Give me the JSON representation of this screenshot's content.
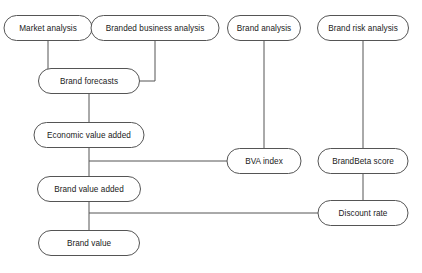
{
  "diagram": {
    "type": "flowchart",
    "background_color": "#ffffff",
    "node_fill_color": "#ffffff",
    "node_border_color": "#555555",
    "edge_color": "#555555",
    "text_color": "#1a1a1a",
    "nodes": [
      {
        "id": "market-analysis",
        "label": "Market analysis",
        "cx": 48,
        "cy": 28,
        "w": 88,
        "h": 25
      },
      {
        "id": "branded-business-analysis",
        "label": "Branded business analysis",
        "cx": 155,
        "cy": 28,
        "w": 128,
        "h": 25
      },
      {
        "id": "brand-analysis",
        "label": "Brand analysis",
        "cx": 264,
        "cy": 28,
        "w": 73,
        "h": 25
      },
      {
        "id": "brand-risk-analysis",
        "label": "Brand risk analysis",
        "cx": 363,
        "cy": 28,
        "w": 91,
        "h": 25
      },
      {
        "id": "brand-forecasts",
        "label": "Brand forecasts",
        "cx": 89,
        "cy": 81,
        "w": 101,
        "h": 25
      },
      {
        "id": "economic-value-added",
        "label": "Economic value added",
        "cx": 89,
        "cy": 135,
        "w": 110,
        "h": 25
      },
      {
        "id": "bva-index",
        "label": "BVA index",
        "cx": 264,
        "cy": 161,
        "w": 74,
        "h": 25
      },
      {
        "id": "brandbeta-score",
        "label": "BrandBeta score",
        "cx": 363,
        "cy": 161,
        "w": 90,
        "h": 25
      },
      {
        "id": "brand-value-added",
        "label": "Brand value added",
        "cx": 89,
        "cy": 189,
        "w": 103,
        "h": 25
      },
      {
        "id": "discount-rate",
        "label": "Discount rate",
        "cx": 363,
        "cy": 213,
        "w": 90,
        "h": 25
      },
      {
        "id": "brand-value",
        "label": "Brand value",
        "cx": 89,
        "cy": 243,
        "w": 101,
        "h": 25
      }
    ],
    "edges": [
      {
        "id": "market-analysis-to-brand-forecasts",
        "from": "market-analysis",
        "to": "brand-forecasts",
        "points": "48,40.5 48,81 38.5,81"
      },
      {
        "id": "branded-business-analysis-to-brand-forecasts",
        "from": "branded-business-analysis",
        "to": "brand-forecasts",
        "points": "155,40.5 155,81 139.5,81"
      },
      {
        "id": "brand-forecasts-to-economic-value-added",
        "from": "brand-forecasts",
        "to": "economic-value-added",
        "points": "89,93.5 89,122.5"
      },
      {
        "id": "economic-value-added-to-brand-value-added",
        "from": "economic-value-added",
        "to": "brand-value-added",
        "points": "89,147.5 89,176.5"
      },
      {
        "id": "brand-analysis-to-bva-index",
        "from": "brand-analysis",
        "to": "bva-index",
        "points": "264,40.5 264,148.5"
      },
      {
        "id": "bva-index-to-spine",
        "from": "bva-index",
        "to": "economic-value-added",
        "points": "227,161 89,161"
      },
      {
        "id": "brand-risk-analysis-to-brandbeta-score",
        "from": "brand-risk-analysis",
        "to": "brandbeta-score",
        "points": "363,40.5 363,148.5"
      },
      {
        "id": "brandbeta-score-to-discount-rate",
        "from": "brandbeta-score",
        "to": "discount-rate",
        "points": "363,173.5 363,200.5"
      },
      {
        "id": "brand-value-added-to-brand-value",
        "from": "brand-value-added",
        "to": "brand-value",
        "points": "89,201.5 89,230.5"
      },
      {
        "id": "discount-rate-to-spine",
        "from": "discount-rate",
        "to": "brand-value-added",
        "points": "318,213 89,213"
      }
    ]
  }
}
